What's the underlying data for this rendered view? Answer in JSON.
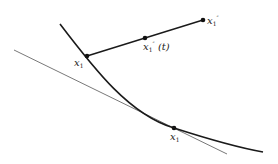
{
  "diagram": {
    "colors": {
      "curve": "#1a1a1a",
      "tangent": "#555555",
      "segment": "#1a1a1a",
      "point": "#111111"
    },
    "curve": {
      "path": "M 60 24 C 95 70, 130 115, 174 128 C 205 138, 235 147, 263 152"
    },
    "tangent": {
      "x1": 14,
      "y1": 50,
      "x2": 227,
      "y2": 154
    },
    "segment": {
      "x1": 87,
      "y1": 56,
      "x2": 203,
      "y2": 20
    },
    "points": [
      {
        "id": "x1",
        "cx": 87,
        "cy": 56
      },
      {
        "id": "x1_dd_t",
        "cx": 145,
        "cy": 38
      },
      {
        "id": "x1_dd",
        "cx": 203,
        "cy": 20
      },
      {
        "id": "x1_hat",
        "cx": 174,
        "cy": 128
      }
    ],
    "labels": {
      "x1": {
        "base": "x",
        "sub": "1"
      },
      "x1_dd_t": {
        "base": "x",
        "sub": "1",
        "sup": "″",
        "arg": "(t)"
      },
      "x1_dd": {
        "base": "x",
        "sub": "1",
        "sup": "″"
      },
      "x1_hat": {
        "base": "x",
        "sub": "1",
        "accent": "^"
      }
    }
  }
}
